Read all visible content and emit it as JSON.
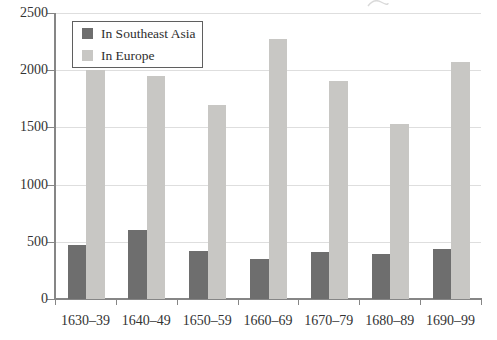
{
  "chart_data": {
    "type": "bar",
    "categories": [
      "1630–39",
      "1640–49",
      "1650–59",
      "1660–69",
      "1670–79",
      "1680–89",
      "1690–99"
    ],
    "series": [
      {
        "name": "In Southeast Asia",
        "color": "#6e6e6e",
        "values": [
          470,
          600,
          420,
          350,
          410,
          390,
          440
        ]
      },
      {
        "name": "In Europe",
        "color": "#c8c7c4",
        "values": [
          2000,
          1950,
          1700,
          2270,
          1910,
          1530,
          2070
        ]
      }
    ],
    "title": "",
    "xlabel": "",
    "ylabel": "",
    "ylim": [
      0,
      2500
    ],
    "yticks": [
      0,
      500,
      1000,
      1500,
      2000,
      2500
    ],
    "grid": true,
    "legend_position": "top-left"
  },
  "colors": {
    "axis": "#868686",
    "gridline": "#dedede",
    "text": "#333333",
    "legend_border": "#5f5f5f",
    "background": "#ffffff",
    "scan_artifact": "#cccccc"
  }
}
